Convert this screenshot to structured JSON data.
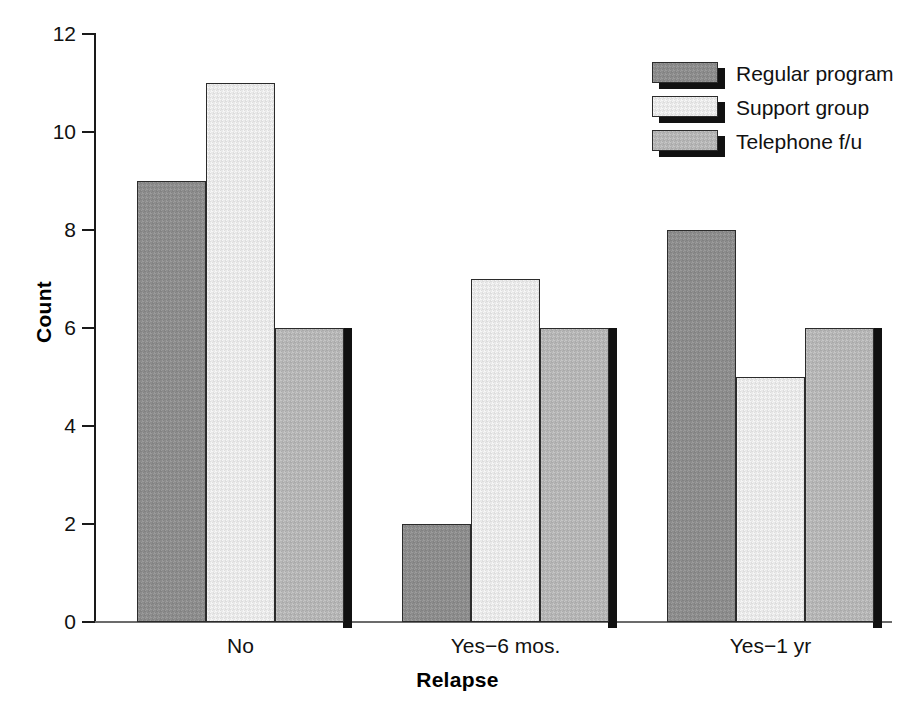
{
  "chart_data": {
    "type": "bar",
    "title": "",
    "xlabel": "Relapse",
    "ylabel": "Count",
    "categories": [
      "No",
      "Yes−6 mos.",
      "Yes−1 yr"
    ],
    "series": [
      {
        "name": "Regular program",
        "values": [
          9,
          2,
          8
        ],
        "color": "#8c8c8c"
      },
      {
        "name": "Support group",
        "values": [
          11,
          7,
          5
        ],
        "color": "#e9e9e9"
      },
      {
        "name": "Telephone f/u",
        "values": [
          6,
          6,
          6
        ],
        "color": "#b5b5b5"
      }
    ],
    "ylim": [
      0,
      12
    ],
    "yticks": [
      0,
      2,
      4,
      6,
      8,
      10,
      12
    ],
    "ytick_labels": [
      "0",
      "2",
      "4",
      "6",
      "8",
      "10",
      "12"
    ],
    "grid": false,
    "legend_position": "top-right",
    "bar_style": "grouped-adjacent-3d-shadow"
  },
  "legend": {
    "items": [
      {
        "label": "Regular program",
        "swatch": "swatch-regular-program"
      },
      {
        "label": "Support group",
        "swatch": "swatch-support-group"
      },
      {
        "label": "Telephone f/u",
        "swatch": "swatch-telephone-fu"
      }
    ]
  },
  "axes": {
    "y_title": "Count",
    "x_title": "Relapse"
  }
}
